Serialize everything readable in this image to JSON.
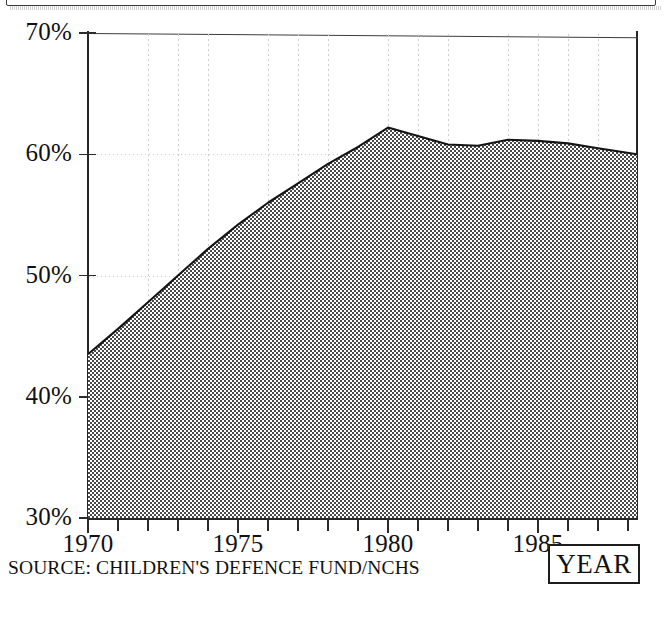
{
  "figure": {
    "source_note": "SOURCE: CHILDREN'S DEFENCE FUND/NCHS",
    "year_box_label": "YEAR"
  },
  "chart_data": {
    "type": "area",
    "title": "",
    "subtitle": "",
    "xlabel": "YEAR",
    "ylabel": "",
    "xlim": [
      1970,
      1988.3
    ],
    "ylim": [
      30,
      70
    ],
    "y_tick_labels": [
      "30%",
      "40%",
      "50%",
      "60%",
      "70%"
    ],
    "y_ticks": [
      30,
      40,
      50,
      60,
      70
    ],
    "x_tick_labels": [
      "1970",
      "1975",
      "1980",
      "1985"
    ],
    "x_ticks_major": [
      1970,
      1975,
      1980,
      1985
    ],
    "x_ticks_minor_step": 1,
    "grid": "dotted vertical and faint horizontal gridlines",
    "legend": "none",
    "fill": "gray checkerboard halftone",
    "line_color": "#1a1a1a",
    "fill_color": "#b3b3b3",
    "x": [
      1970,
      1971,
      1972,
      1973,
      1974,
      1975,
      1976,
      1977,
      1978,
      1979,
      1980,
      1981,
      1982,
      1983,
      1984,
      1985,
      1986,
      1987,
      1988.3
    ],
    "values": [
      43.5,
      45.6,
      47.8,
      50.0,
      52.2,
      54.2,
      56.0,
      57.6,
      59.2,
      60.6,
      62.2,
      61.5,
      60.8,
      60.7,
      61.2,
      61.1,
      60.9,
      60.5,
      60.0
    ],
    "annotations": []
  }
}
